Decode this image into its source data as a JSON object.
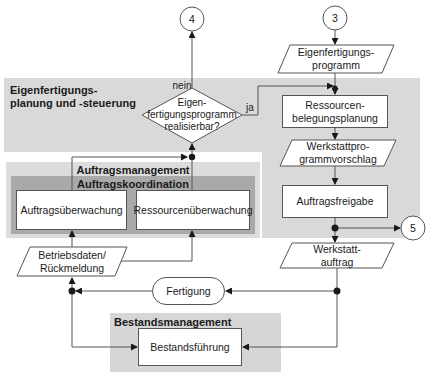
{
  "regions": {
    "planning": "Eigenfertigungs-\nplanung und -steuerung",
    "order_management": "Auftragsmanagement",
    "order_coordination": "Auftragskoordination",
    "inventory_management": "Bestandsmanagement"
  },
  "connectors": {
    "top_left": "4",
    "top_right": "3",
    "right_exit": "5"
  },
  "decision": {
    "text": "Eigen-\nfertigungsprogramm\nrealisierbar?",
    "no_label": "nein",
    "yes_label": "ja"
  },
  "data_items": {
    "production_program": "Eigenfertigungs-\nprogramm",
    "workshop_program_proposal": "Werkstattpro-\ngrammvorschlag",
    "workshop_order": "Werkstatt-\nauftrag",
    "operating_data": "Betriebsdaten/\nRückmeldung"
  },
  "processes": {
    "resource_scheduling": "Ressourcen-\nbelegungsplanung",
    "order_release": "Auftragsfreigabe",
    "order_monitoring": "Auftragsüberwachung",
    "resource_monitoring": "Ressourcenüberwachung",
    "inventory_control": "Bestandsführung"
  },
  "external": {
    "production": "Fertigung"
  },
  "colors": {
    "region_light": "#d9d9d9",
    "region_dark": "#a9a9a9",
    "line": "#555555"
  }
}
